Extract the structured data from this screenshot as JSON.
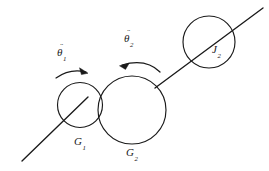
{
  "figure": {
    "type": "mechanical-gear-train-diagram",
    "background_color": "#ffffff",
    "stroke_color": "#1a1a1a",
    "width": 269,
    "height": 171,
    "labels": {
      "gear1": {
        "symbol": "G",
        "subscript": "1"
      },
      "gear2": {
        "symbol": "G",
        "subscript": "2"
      },
      "inertia2": {
        "symbol": "J",
        "subscript": "2"
      },
      "accel1": {
        "symbol": "θ",
        "accent": "¨",
        "subscript": "1"
      },
      "accel2": {
        "symbol": "θ",
        "accent": "¨",
        "subscript": "2"
      }
    },
    "elements": {
      "gear1_circle": {
        "cx": 80,
        "cy": 105,
        "r": 22.5
      },
      "gear2_circle": {
        "cx": 132,
        "cy": 110,
        "r": 34
      },
      "inertia2_circle": {
        "cx": 209,
        "cy": 42,
        "r": 26
      },
      "shaft1": {
        "x1": 22,
        "y1": 161,
        "x2": 88,
        "y2": 97
      },
      "shaft2": {
        "x1": 155,
        "y1": 88,
        "x2": 263,
        "y2": 8
      },
      "arrow1_direction": "clockwise",
      "arrow2_direction": "counterclockwise"
    }
  }
}
